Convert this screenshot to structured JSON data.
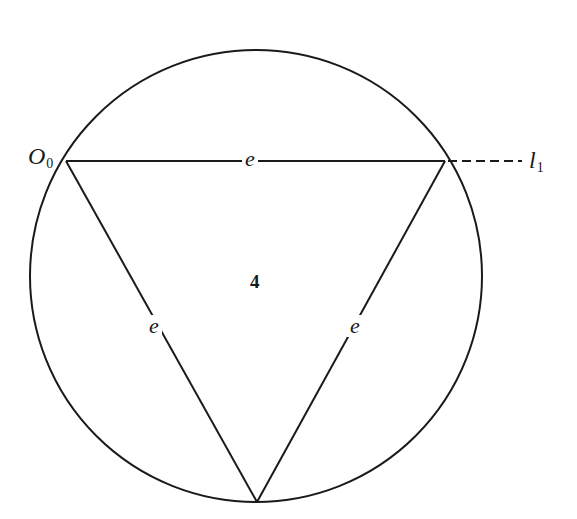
{
  "diagram": {
    "type": "inscribed-equilateral-triangle",
    "stroke_color": "#1a1a1a",
    "background": "#ffffff",
    "circle": {
      "cx": 256,
      "cy": 276,
      "r": 226
    },
    "vertices": {
      "top_left": {
        "x": 66,
        "y": 161
      },
      "top_right": {
        "x": 445,
        "y": 161
      },
      "bottom": {
        "x": 257,
        "y": 502
      }
    },
    "dashed_line": {
      "from_x": 448,
      "to_x": 522,
      "y": 161
    },
    "labels": {
      "origin_point": {
        "main": "O",
        "sub": "0"
      },
      "line": {
        "main": "l",
        "sub": "1"
      },
      "edge_top": "e",
      "edge_left": "e",
      "edge_right": "e",
      "face": "4"
    }
  }
}
